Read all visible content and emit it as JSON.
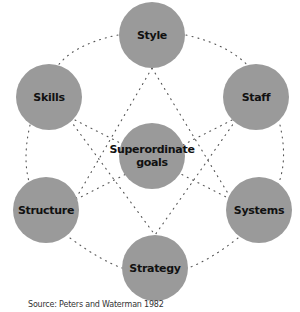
{
  "diagram": {
    "nodes": [
      {
        "id": "style",
        "label": "Style",
        "cx": 152,
        "cy": 35,
        "r": 33
      },
      {
        "id": "skills",
        "label": "Skills",
        "cx": 49,
        "cy": 97,
        "r": 33
      },
      {
        "id": "staff",
        "label": "Staff",
        "cx": 256,
        "cy": 97,
        "r": 33
      },
      {
        "id": "superordinate",
        "label": "Superordinate goals",
        "cx": 152,
        "cy": 156,
        "r": 33
      },
      {
        "id": "structure",
        "label": "Structure",
        "cx": 46,
        "cy": 210,
        "r": 33
      },
      {
        "id": "systems",
        "label": "Systems",
        "cx": 259,
        "cy": 210,
        "r": 33
      },
      {
        "id": "strategy",
        "label": "Strategy",
        "cx": 155,
        "cy": 268,
        "r": 33
      }
    ],
    "colors": {
      "node_fill": "#9a9a9a",
      "link": "#555555",
      "text": "#111111"
    }
  },
  "source": "Source: Peters and Waterman 1982"
}
